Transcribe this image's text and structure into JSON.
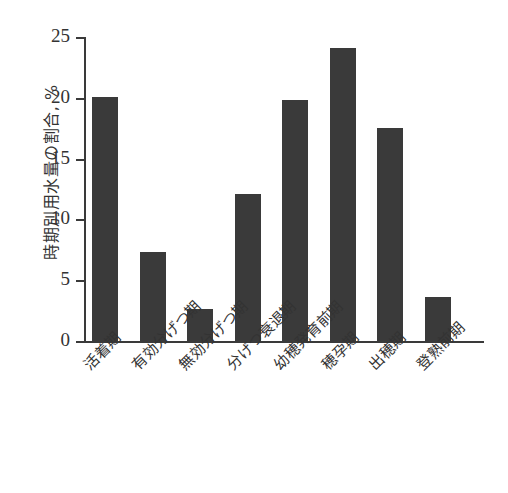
{
  "chart_data": {
    "type": "bar",
    "title": "",
    "xlabel": "",
    "ylabel": "時期別用水量の割合, %",
    "ylim": [
      0,
      25
    ],
    "yticks": [
      0,
      5,
      10,
      15,
      20,
      25
    ],
    "ytick_labels": [
      "0",
      "5",
      "10",
      "15",
      "20",
      "25"
    ],
    "grid": false,
    "legend": "none",
    "categories": [
      "活着期",
      "有効分げつ期",
      "無効分げつ期",
      "分げつ衰退期",
      "幼穂発育前期",
      "穂孕期",
      "出穂期",
      "登熟前期"
    ],
    "values": [
      20.1,
      7.3,
      2.6,
      12.1,
      19.8,
      24.1,
      17.5,
      3.6
    ],
    "bar_color": "#3a3a3a",
    "axis_color": "#3a3a3a"
  }
}
